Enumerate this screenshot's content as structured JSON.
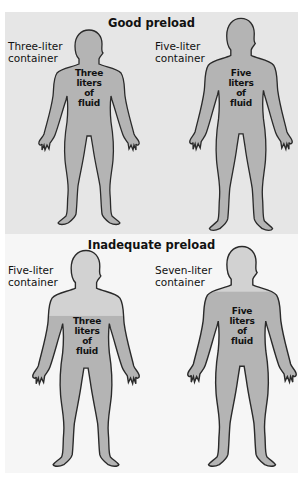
{
  "panels": [
    {
      "title": "Good preload",
      "figures": [
        {
          "container_label_1": "Three-liter",
          "container_label_2": "container",
          "fluid_1": "Three",
          "fluid_2": "liters",
          "fluid_3": "of",
          "fluid_4": "fluid"
        },
        {
          "container_label_1": "Five-liter",
          "container_label_2": "container",
          "fluid_1": "Five",
          "fluid_2": "liters",
          "fluid_3": "of",
          "fluid_4": "fluid"
        }
      ]
    },
    {
      "title": "Inadequate preload",
      "figures": [
        {
          "container_label_1": "Five-liter",
          "container_label_2": "container",
          "fluid_1": "Three",
          "fluid_2": "liters",
          "fluid_3": "of",
          "fluid_4": "fluid"
        },
        {
          "container_label_1": "Seven-liter",
          "container_label_2": "container",
          "fluid_1": "Five",
          "fluid_2": "liters",
          "fluid_3": "of",
          "fluid_4": "fluid"
        }
      ]
    }
  ],
  "colors": {
    "top_bg": "#e6e6e6",
    "bottom_bg": "#f6f6f6",
    "fluid_fill": "#b4b4b4",
    "empty_fill": "#d2d2d2",
    "outline": "#2a2a2a"
  }
}
